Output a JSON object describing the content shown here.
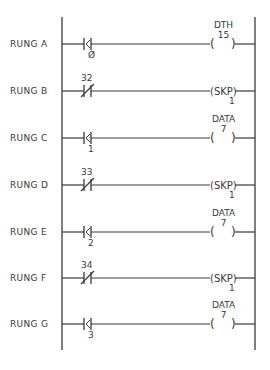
{
  "diagram": {
    "type": "ladder-logic",
    "colors": {
      "line": "#3a3a3a",
      "background": "#ffffff"
    },
    "rails": {
      "left_x": 62,
      "right_x": 255,
      "top_y": 17,
      "bottom_y": 350
    },
    "rungs": [
      {
        "label": "RUNG A",
        "y": 44,
        "contact": {
          "type": "K-contact",
          "label": "Ø",
          "label_pos": "below"
        },
        "output": {
          "type": "coil",
          "top": "DTH",
          "inner": "15",
          "bottom": ""
        }
      },
      {
        "label": "RUNG B",
        "y": 91,
        "contact": {
          "type": "normally-closed",
          "label": "32",
          "label_pos": "above"
        },
        "output": {
          "type": "skip",
          "top": "",
          "inner": "SKP",
          "bottom": "1"
        }
      },
      {
        "label": "RUNG C",
        "y": 138,
        "contact": {
          "type": "K-contact",
          "label": "1",
          "label_pos": "below"
        },
        "output": {
          "type": "coil",
          "top": "DATA",
          "inner": "7",
          "bottom": ""
        }
      },
      {
        "label": "RUNG D",
        "y": 185,
        "contact": {
          "type": "normally-closed",
          "label": "33",
          "label_pos": "above"
        },
        "output": {
          "type": "skip",
          "top": "",
          "inner": "SKP",
          "bottom": "1"
        }
      },
      {
        "label": "RUNG E",
        "y": 232,
        "contact": {
          "type": "K-contact",
          "label": "2",
          "label_pos": "below"
        },
        "output": {
          "type": "coil",
          "top": "DATA",
          "inner": "7",
          "bottom": ""
        }
      },
      {
        "label": "RUNG F",
        "y": 278,
        "contact": {
          "type": "normally-closed",
          "label": "34",
          "label_pos": "above"
        },
        "output": {
          "type": "skip",
          "top": "",
          "inner": "SKP",
          "bottom": "1"
        }
      },
      {
        "label": "RUNG G",
        "y": 324,
        "contact": {
          "type": "K-contact",
          "label": "3",
          "label_pos": "below"
        },
        "output": {
          "type": "coil",
          "top": "DATA",
          "inner": "7",
          "bottom": ""
        }
      }
    ]
  }
}
